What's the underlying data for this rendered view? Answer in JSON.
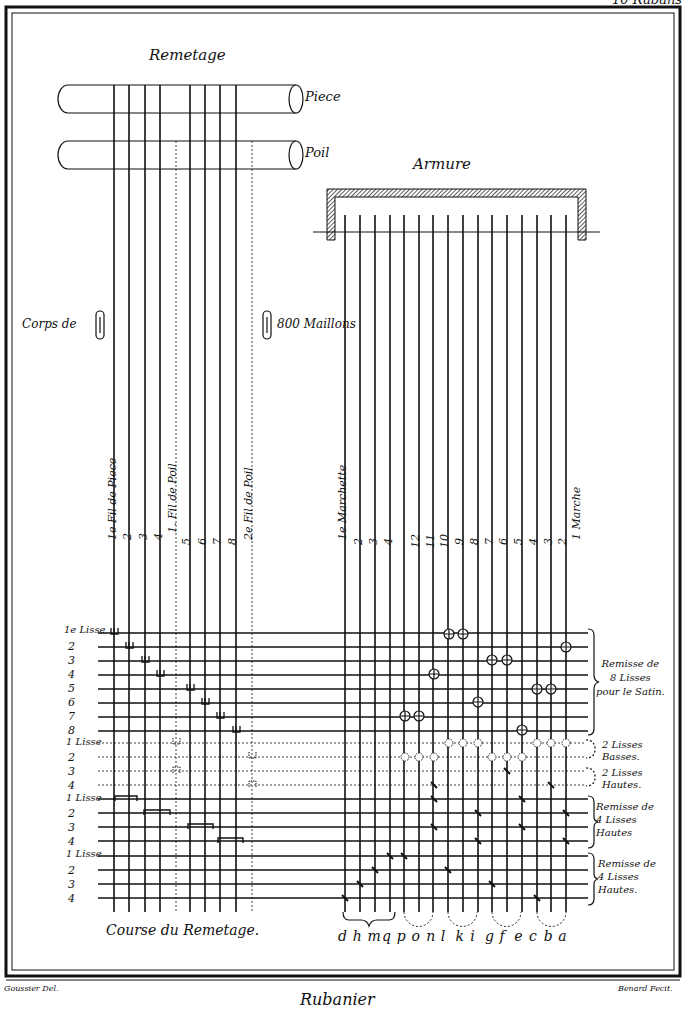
{
  "plate": {
    "corner_label": "10 Rubans",
    "credit_left": "Goussier Del.",
    "credit_right": "Benard Fecit.",
    "footer_title": "Rubanier"
  },
  "remetage": {
    "title": "Remetage",
    "rollers": [
      {
        "label": "Piece"
      },
      {
        "label": "Poil"
      }
    ],
    "corps_label_left": "Corps de",
    "corps_label_right": "800 Maillons",
    "thread_labels": [
      "1e Fil de Piece",
      "2",
      "3",
      "4",
      "1. Fil de Poil",
      "5",
      "6",
      "7",
      "8",
      "2e Fil de Poil"
    ],
    "caption": "Course du Remetage."
  },
  "armure": {
    "title": "Armure",
    "marche_labels": [
      "1e Marchette",
      "2",
      "3",
      "4",
      "12",
      "11",
      "10",
      "9",
      "8",
      "7",
      "6",
      "5",
      "4",
      "3",
      "2",
      "1 Marche"
    ],
    "letters": [
      "d",
      "h",
      "m",
      "q",
      "p",
      "o",
      "n",
      "l",
      "k",
      "i",
      "g",
      "f",
      "e",
      "c",
      "b",
      "a"
    ]
  },
  "rows": {
    "group1_numbers": [
      "1e Lisse",
      "2",
      "3",
      "4",
      "5",
      "6",
      "7",
      "8"
    ],
    "group2_numbers": [
      "1 Lisse",
      "2",
      "3",
      "4"
    ],
    "group3_numbers": [
      "1 Lisse",
      "2",
      "3",
      "4"
    ],
    "group4_numbers": [
      "1 Lisse",
      "2",
      "3",
      "4"
    ]
  },
  "legends": {
    "g1": [
      "Remisse de",
      "8 Lisses",
      "pour le Satin."
    ],
    "g2": [
      "2 Lisses",
      "Basses."
    ],
    "g3": [
      "2 Lisses",
      "Hautes."
    ],
    "g4": [
      "Remisse de",
      "4 Lisses",
      "Hautes"
    ],
    "g5": [
      "Remisse de",
      "4 Lisses",
      "Hautes."
    ]
  }
}
